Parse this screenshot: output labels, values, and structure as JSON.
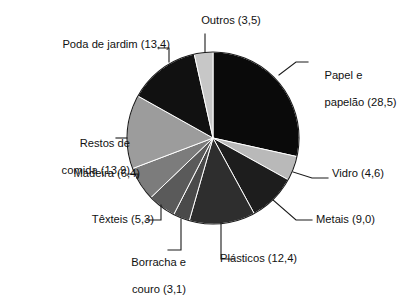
{
  "chart_data": {
    "type": "pie",
    "title": "",
    "subtitle": "",
    "xlabel": "",
    "ylabel": "",
    "legend_position": "none",
    "grid": false,
    "decimal_separator": ",",
    "value_format": "(v)",
    "start_angle_deg": 0,
    "direction": "clockwise",
    "categories": [
      "Papel e papelão",
      "Vidro",
      "Metais",
      "Plásticos",
      "Borracha e couro",
      "Têxteis",
      "Madeira",
      "Restos de comida",
      "Poda de jardim",
      "Outros"
    ],
    "values": [
      28.5,
      4.6,
      9.0,
      12.4,
      3.1,
      5.3,
      6.4,
      13.9,
      13.4,
      3.5
    ],
    "total": 100.1,
    "colors": [
      "#0a0a0a",
      "#b9b9b9",
      "#1d1d1d",
      "#2e2e2e",
      "#4a4a4a",
      "#5a5a5a",
      "#7c7c7c",
      "#9c9c9c",
      "#111111",
      "#c7c7c7"
    ],
    "slices": [
      {
        "label": "Papel e papelão",
        "value": 28.5,
        "value_text": "28,5",
        "color": "#0a0a0a"
      },
      {
        "label": "Vidro",
        "value": 4.6,
        "value_text": "4,6",
        "color": "#b9b9b9"
      },
      {
        "label": "Metais",
        "value": 9.0,
        "value_text": "9,0",
        "color": "#1d1d1d"
      },
      {
        "label": "Plásticos",
        "value": 12.4,
        "value_text": "12,4",
        "color": "#2e2e2e"
      },
      {
        "label": "Borracha e couro",
        "value": 3.1,
        "value_text": "3,1",
        "color": "#4a4a4a"
      },
      {
        "label": "Têxteis",
        "value": 5.3,
        "value_text": "5,3",
        "color": "#5a5a5a"
      },
      {
        "label": "Madeira",
        "value": 6.4,
        "value_text": "6,4",
        "color": "#7c7c7c"
      },
      {
        "label": "Restos de comida",
        "value": 13.9,
        "value_text": "13,9",
        "color": "#9c9c9c"
      },
      {
        "label": "Poda de jardim",
        "value": 13.4,
        "value_text": "13,4",
        "color": "#111111"
      },
      {
        "label": "Outros",
        "value": 3.5,
        "value_text": "3,5",
        "color": "#c7c7c7"
      }
    ]
  },
  "labels": {
    "outros": "Outros (3,5)",
    "papel_line1": "Papel e",
    "papel_line2": "papelão (28,5)",
    "vidro": "Vidro (4,6)",
    "metais": "Metais (9,0)",
    "plasticos": "Plásticos (12,4)",
    "borracha_line1": "Borracha e",
    "borracha_line2": "couro (3,1)",
    "texteis": "Têxteis (5,3)",
    "madeira": "Madeira (6,4)",
    "restos_line1": "Restos de",
    "restos_line2": "comida (13,9)",
    "poda": "Poda de jardim (13,4)"
  }
}
